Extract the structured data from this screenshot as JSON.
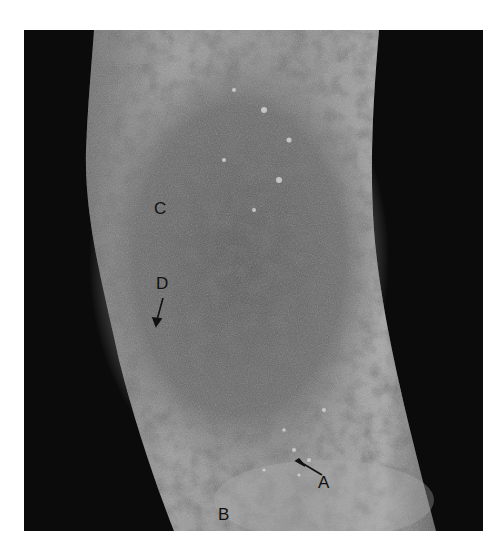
{
  "figure": {
    "labels": [
      {
        "id": "A",
        "text": "A",
        "has_arrow": true
      },
      {
        "id": "B",
        "text": "B",
        "has_arrow": false
      },
      {
        "id": "C",
        "text": "C",
        "has_arrow": false
      },
      {
        "id": "D",
        "text": "D",
        "has_arrow": true
      }
    ],
    "colors": {
      "background": "#0b0b0b",
      "skin_light": "#a8a8a8",
      "skin_mid": "#7c7c7c",
      "lesion_dark": "#4a4a4a",
      "label": "#111111"
    }
  }
}
